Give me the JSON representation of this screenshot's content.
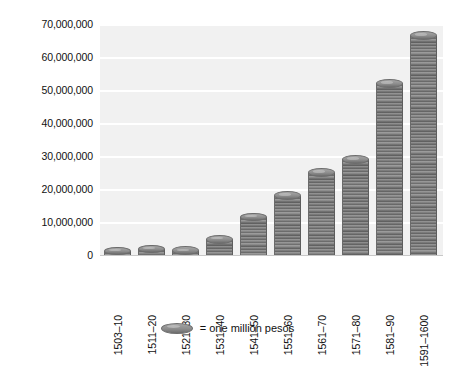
{
  "chart_data": {
    "type": "bar",
    "title": "",
    "subtitle": "",
    "xlabel": "",
    "ylabel": "",
    "categories": [
      "1503–10",
      "1511–20",
      "1521–30",
      "1531–40",
      "1541–50",
      "1551–60",
      "1561–70",
      "1571–80",
      "1581–90",
      "1591–1600"
    ],
    "values": [
      1200000,
      1800000,
      1300000,
      4800000,
      11500000,
      18000000,
      25000000,
      29000000,
      52000000,
      66500000
    ],
    "series": [
      {
        "name": "Treasure imports (pesos)",
        "values": [
          1200000,
          1800000,
          1300000,
          4800000,
          11500000,
          18000000,
          25000000,
          29000000,
          52000000,
          66500000
        ]
      }
    ],
    "ylim": [
      0,
      70000000
    ],
    "ytick_values": [
      0,
      10000000,
      20000000,
      30000000,
      40000000,
      50000000,
      60000000,
      70000000
    ],
    "ytick_labels": [
      "0",
      "10,000,000",
      "20,000,000",
      "30,000,000",
      "40,000,000",
      "50,000,000",
      "60,000,000",
      "70,000,000"
    ],
    "grid": true,
    "grid_axis": "y",
    "legend_position": "bottom-center",
    "legend": [
      {
        "icon": "coin-icon",
        "label": "= one million pesos"
      }
    ],
    "annotations": [],
    "colors": {
      "bar_fill": "#8a8a8a",
      "bar_ridge": "#5f5f5f",
      "bar_top": "#a6a6a6",
      "plot_background": "#f1f1f1",
      "gridline": "#ffffff",
      "figure_background": "#ffffff",
      "text": "#111111"
    }
  },
  "legend": {
    "coin_icon_name": "coin-icon",
    "text": "= one million pesos"
  }
}
